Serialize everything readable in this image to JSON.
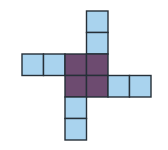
{
  "diagram": {
    "type": "cube-net",
    "cell_size": 21.5,
    "origin": {
      "x": 22,
      "y": 11
    },
    "colors": {
      "arm": "#a9d3ee",
      "center": "#6d4b70",
      "border": "#263038",
      "background": "#ffffff"
    },
    "cells": [
      {
        "col": 3,
        "row": 0,
        "kind": "arm",
        "group": "top"
      },
      {
        "col": 3,
        "row": 1,
        "kind": "arm",
        "group": "top"
      },
      {
        "col": 0,
        "row": 2,
        "kind": "arm",
        "group": "left"
      },
      {
        "col": 1,
        "row": 2,
        "kind": "arm",
        "group": "left"
      },
      {
        "col": 2,
        "row": 2,
        "kind": "center",
        "group": "center"
      },
      {
        "col": 3,
        "row": 2,
        "kind": "center",
        "group": "center"
      },
      {
        "col": 2,
        "row": 3,
        "kind": "center",
        "group": "center"
      },
      {
        "col": 3,
        "row": 3,
        "kind": "center",
        "group": "center"
      },
      {
        "col": 4,
        "row": 3,
        "kind": "arm",
        "group": "right"
      },
      {
        "col": 5,
        "row": 3,
        "kind": "arm",
        "group": "right"
      },
      {
        "col": 2,
        "row": 4,
        "kind": "arm",
        "group": "bottom"
      },
      {
        "col": 2,
        "row": 5,
        "kind": "arm",
        "group": "bottom"
      }
    ]
  }
}
